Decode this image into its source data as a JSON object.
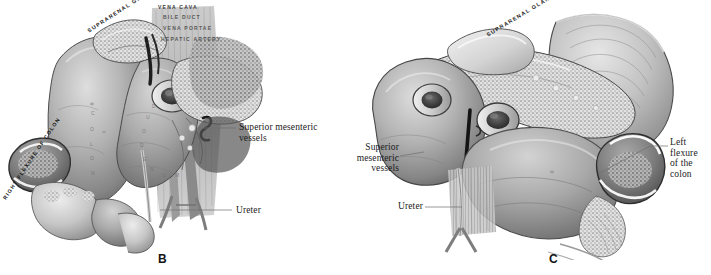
{
  "figure": {
    "kind": "anatomical-illustration",
    "style": "grayscale halftone engraving",
    "background_color": "#ffffff",
    "ink_color": "#1b1b1b",
    "panels": [
      {
        "id": "B",
        "letter": "B",
        "subject": "Duodenum, pancreas and right kidney region — right flexure of the colon retracted",
        "engraved_labels": [
          {
            "name": "suprarenal-gland",
            "text": "SUPRARENAL GLAND"
          },
          {
            "name": "vena-cava",
            "text": "VENA CAVA"
          },
          {
            "name": "bile-duct",
            "text": "BILE DUCT"
          },
          {
            "name": "vena-portae",
            "text": "VENA PORTAE"
          },
          {
            "name": "hepatic-artery",
            "text": "HEPATIC ARTERY"
          },
          {
            "name": "right-flexure-of-colon",
            "text": "RIGHT FLEXURE OF COLON"
          },
          {
            "name": "colon-surface-mark",
            "text": "C O L O N"
          }
        ],
        "callouts": [
          {
            "name": "superior-mesenteric-vessels",
            "text": "Superior mesenteric\nvessels"
          },
          {
            "name": "ureter",
            "text": "Ureter"
          }
        ]
      },
      {
        "id": "C",
        "letter": "C",
        "subject": "Left kidney, pancreas and spleen region — left flexure of the colon exposed",
        "engraved_labels": [
          {
            "name": "suprarenal-gland",
            "text": "SUPRARENAL GLAND"
          }
        ],
        "callouts": [
          {
            "name": "superior-mesenteric-vessels",
            "text": "Superior\nmesenteric\nvessels"
          },
          {
            "name": "ureter",
            "text": "Ureter"
          },
          {
            "name": "left-flexure-of-the-colon",
            "text": "Left flexure\nof the colon"
          }
        ]
      }
    ]
  },
  "panel_b": {
    "letter": "B",
    "label_suprarenal_gland": "SUPRARENAL GLAND",
    "label_vena_cava": "VENA CAVA",
    "label_bile_duct": "BILE DUCT",
    "label_vena_portae": "VENA PORTAE",
    "label_hepatic_artery": "HEPATIC ARTERY",
    "label_right_flexure": "RIGHT FLEXURE OF COLON",
    "label_colon_c": "C",
    "label_colon_o": "O",
    "label_colon_l": "L",
    "label_colon_o2": "O",
    "label_colon_n": "N",
    "label_duo_d": "D",
    "label_duo_u": "U",
    "label_duo_o": "O",
    "label_duo_d2": "D",
    "label_duo_e": "E",
    "label_duo_n": "N",
    "label_duo_u2": "U",
    "label_duo_m": "M",
    "callout_superior_mesenteric": "Superior mesenteric\nvessels",
    "callout_ureter": "Ureter"
  },
  "panel_c": {
    "letter": "C",
    "label_suprarenal_gland": "SUPRARENAL GLAND",
    "callout_superior_mesenteric": "Superior\nmesenteric\nvessels",
    "callout_ureter": "Ureter",
    "callout_left_flexure": "Left flexure\nof the colon"
  },
  "colors": {
    "ink": "#1b1b1b",
    "paper": "#ffffff",
    "mid_tone": "#9a9a9a",
    "dark_tone": "#3c3c3c",
    "light_tone": "#d8d8d8",
    "leader_line": "#8c8c8c"
  }
}
